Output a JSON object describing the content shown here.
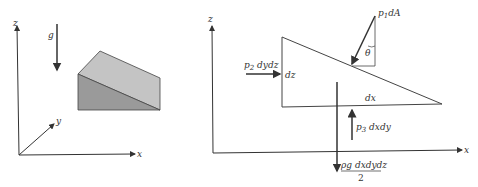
{
  "left_panel": {
    "axes": {
      "z": "z",
      "y": "y",
      "x": "x"
    },
    "gravity_label": "g",
    "colors": {
      "top_face": "#c4c4c4",
      "side_face": "#9a9a9a",
      "edge": "#444444"
    }
  },
  "right_panel": {
    "axes": {
      "z": "z",
      "x": "x"
    },
    "force_p1": {
      "symbol": "p",
      "sub": "1",
      "rest": "dA"
    },
    "angle_label": "θ",
    "force_p2": {
      "symbol": "p",
      "sub": "2",
      "rest": " dydz"
    },
    "dz_label": "dz",
    "dx_label": "dx",
    "force_p3": {
      "symbol": "p",
      "sub": "3",
      "rest": " dxdy"
    },
    "weight": {
      "numerator": "ρg dxdydz",
      "denominator": "2"
    }
  }
}
